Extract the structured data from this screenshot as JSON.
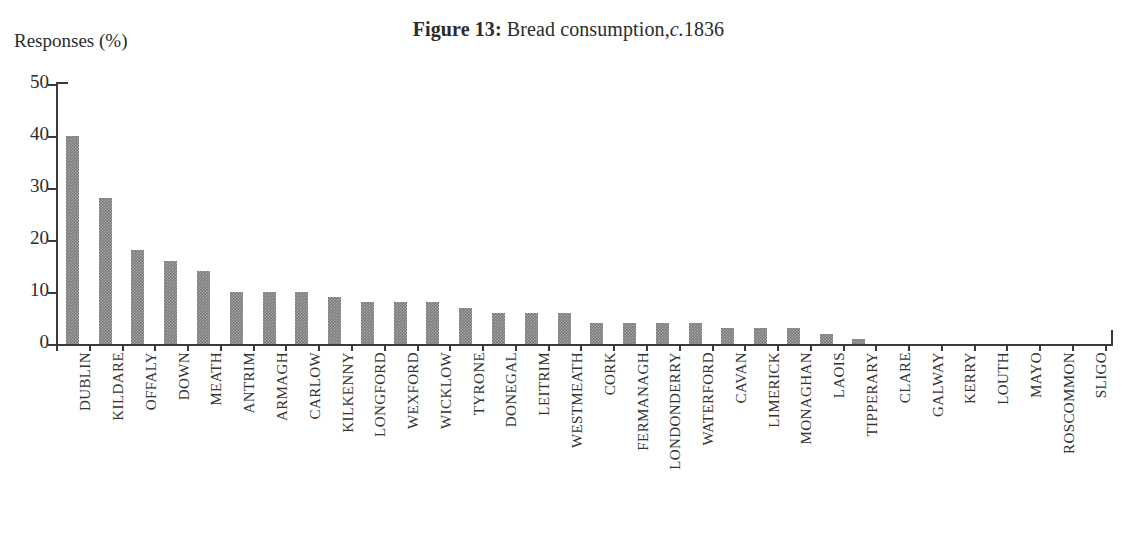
{
  "figure": {
    "label": "Figure 13:",
    "caption_before": "Bread consumption,",
    "circa": "c.",
    "year": "1836",
    "full_title": "Figure 13: Bread consumption, c.1836"
  },
  "axes": {
    "y_axis_title": "Responses (%)",
    "y_ticks": [
      "0",
      "10",
      "20",
      "30",
      "40",
      "50"
    ],
    "x_axis_title": ""
  },
  "colors": {
    "bar_fill": "#7b7b7b",
    "axis": "#3a3a3a",
    "text": "#2b2b2b",
    "background": "#ffffff"
  },
  "scan_artifact": "",
  "chart_data": {
    "type": "bar",
    "xlabel": "",
    "ylabel": "Responses (%)",
    "ylim": [
      0,
      50
    ],
    "ytick_step": 10,
    "grid": false,
    "legend": "none",
    "orientation": "vertical",
    "categories": [
      "DUBLIN",
      "KILDARE",
      "OFFALY",
      "DOWN",
      "MEATH",
      "ANTRIM",
      "ARMAGH",
      "CARLOW",
      "KILKENNY",
      "LONGFORD",
      "WEXFORD",
      "WICKLOW",
      "TYRONE",
      "DONEGAL",
      "LEITRIM",
      "WESTMEATH",
      "CORK",
      "FERMANAGH",
      "LONDONDERRY",
      "WATERFORD",
      "CAVAN",
      "LIMERICK",
      "MONAGHAN",
      "LAOIS",
      "TIPPERARY",
      "CLARE",
      "GALWAY",
      "KERRY",
      "LOUTH",
      "MAYO",
      "ROSCOMMON",
      "SLIGO"
    ],
    "values": [
      40,
      28,
      18,
      16,
      14,
      10,
      10,
      10,
      9,
      8,
      8,
      8,
      7,
      6,
      6,
      6,
      4,
      4,
      4,
      4,
      3,
      3,
      3,
      2,
      1,
      0,
      0,
      0,
      0,
      0,
      0,
      0
    ]
  }
}
